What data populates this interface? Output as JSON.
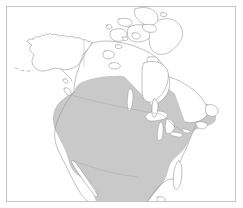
{
  "figure": {
    "type": "range-map",
    "region_title": "North America",
    "frame": {
      "border_color": "#c4c4c4",
      "background_color": "#ffffff",
      "x": 6,
      "y": 6,
      "width": 230,
      "height": 196
    },
    "colors": {
      "land_fill": "#ffffff",
      "land_outline": "#8d8d8d",
      "range_shading": "#c9c9c9",
      "range_outline": "#b0b0b0",
      "internal_border": "#a8a8a8",
      "water_fill": "#ffffff",
      "frame": "#c4c4c4",
      "page_background": "#ffffff"
    },
    "legend_present": false,
    "axis_labels_present": false,
    "scale_bar_present": false,
    "north_arrow_present": false
  },
  "layers": [
    {
      "id": "landmass",
      "name": "North America landmass outline",
      "fill": "#ffffff",
      "stroke": "#8d8d8d",
      "includes": [
        "Alaska",
        "Canada mainland",
        "Canadian Arctic Archipelago",
        "Contiguous United States",
        "Mexico",
        "Baja California",
        "Newfoundland",
        "Vancouver Island",
        "Florida Peninsula",
        "Yucatan Peninsula"
      ]
    },
    {
      "id": "range-shading",
      "name": "Shaded distribution range",
      "fill": "#c9c9c9",
      "stroke": "#b0b0b0",
      "northern_limit_description": "Cuts across southern Canada from British Columbia to the Gulf of St. Lawrence",
      "southern_limit_description": "Extends through Mexico to the bottom edge of the map frame",
      "covers": [
        "Contiguous United States",
        "Southern Canada",
        "Mexico"
      ],
      "excludes": [
        "Alaska",
        "Canadian Arctic Archipelago",
        "Hudson Bay",
        "Northern Canada",
        "Great Lakes water bodies"
      ]
    },
    {
      "id": "water-bodies",
      "name": "Inland water bodies",
      "fill": "#ffffff",
      "stroke": "#8d8d8d",
      "features": [
        "Hudson Bay",
        "Lake Superior",
        "Lake Michigan",
        "Lake Huron",
        "Lake Erie",
        "Lake Ontario",
        "Lake Winnipeg",
        "Great Slave Lake",
        "Great Bear Lake",
        "Gulf of California"
      ]
    },
    {
      "id": "internal-borders",
      "name": "Political boundaries",
      "stroke": "#a8a8a8",
      "features": [
        "United States - Canada border (49th parallel)",
        "Alaska - Yukon border",
        "United States - Mexico border"
      ]
    }
  ]
}
